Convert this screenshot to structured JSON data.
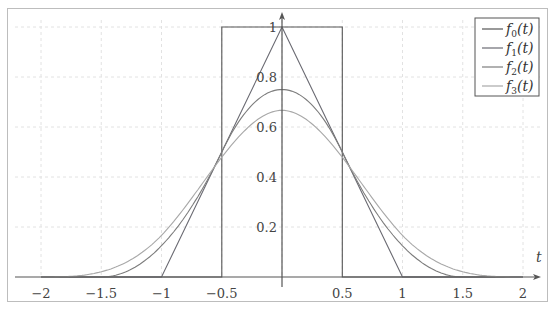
{
  "chart_data": {
    "type": "line",
    "title": "",
    "xlabel": "t",
    "ylabel": "",
    "xlim": [
      -2.1,
      2.2
    ],
    "ylim": [
      0,
      1.05
    ],
    "grid": true,
    "legend_position": "top-right",
    "x_ticks": [
      -2,
      -1.5,
      -1,
      -0.5,
      0.5,
      1,
      1.5,
      2
    ],
    "x_tick_labels": [
      "−2",
      "−1.5",
      "−1",
      "−0.5",
      "0.5",
      "1",
      "1.5",
      "2"
    ],
    "y_ticks": [
      0.2,
      0.4,
      0.6,
      0.8,
      1
    ],
    "y_tick_labels": [
      "0.2",
      "0.4",
      "0.6",
      "0.8",
      "1"
    ],
    "series": [
      {
        "name": "f0(t)",
        "label_main": "f",
        "label_sub": "0",
        "label_rest": "(t)",
        "color": "#555555",
        "description": "box function, 1 on [-0.5, 0.5]",
        "points": [
          [
            -2,
            0
          ],
          [
            -0.5,
            0
          ],
          [
            -0.5,
            1
          ],
          [
            0.5,
            1
          ],
          [
            0.5,
            0
          ],
          [
            2,
            0
          ]
        ]
      },
      {
        "name": "f1(t)",
        "label_main": "f",
        "label_sub": "1",
        "label_rest": "(t)",
        "color": "#6a6a72",
        "description": "triangle function on [-1, 1], peak 1",
        "points": [
          [
            -2,
            0
          ],
          [
            -1,
            0
          ],
          [
            0,
            1
          ],
          [
            1,
            0
          ],
          [
            2,
            0
          ]
        ]
      },
      {
        "name": "f2(t)",
        "label_main": "f",
        "label_sub": "2",
        "label_rest": "(t)",
        "color": "#7c7c7c",
        "description": "quadratic B-spline on [-1.5, 1.5], peak 0.75",
        "points": [
          [
            -2,
            0
          ],
          [
            -1.5,
            0
          ],
          [
            -1.25,
            0.03125
          ],
          [
            -1,
            0.125
          ],
          [
            -0.75,
            0.28125
          ],
          [
            -0.5,
            0.5
          ],
          [
            -0.25,
            0.6875
          ],
          [
            0,
            0.75
          ],
          [
            0.25,
            0.6875
          ],
          [
            0.5,
            0.5
          ],
          [
            0.75,
            0.28125
          ],
          [
            1,
            0.125
          ],
          [
            1.25,
            0.03125
          ],
          [
            1.5,
            0
          ],
          [
            2,
            0
          ]
        ]
      },
      {
        "name": "f3(t)",
        "label_main": "f",
        "label_sub": "3",
        "label_rest": "(t)",
        "color": "#a8a8a8",
        "description": "cubic B-spline on [-2, 2], peak 2/3",
        "points": [
          [
            -2,
            0
          ],
          [
            -1.75,
            0.0026
          ],
          [
            -1.5,
            0.0208
          ],
          [
            -1.25,
            0.0703
          ],
          [
            -1,
            0.1667
          ],
          [
            -0.75,
            0.3151
          ],
          [
            -0.5,
            0.4792
          ],
          [
            -0.25,
            0.612
          ],
          [
            0,
            0.6667
          ],
          [
            0.25,
            0.612
          ],
          [
            0.5,
            0.4792
          ],
          [
            0.75,
            0.3151
          ],
          [
            1,
            0.1667
          ],
          [
            1.25,
            0.0703
          ],
          [
            1.5,
            0.0208
          ],
          [
            1.75,
            0.0026
          ],
          [
            2,
            0
          ]
        ]
      }
    ]
  },
  "legend": {
    "items": [
      {
        "main": "f",
        "sub": "0",
        "rest": "(t)"
      },
      {
        "main": "f",
        "sub": "1",
        "rest": "(t)"
      },
      {
        "main": "f",
        "sub": "2",
        "rest": "(t)"
      },
      {
        "main": "f",
        "sub": "3",
        "rest": "(t)"
      }
    ]
  }
}
